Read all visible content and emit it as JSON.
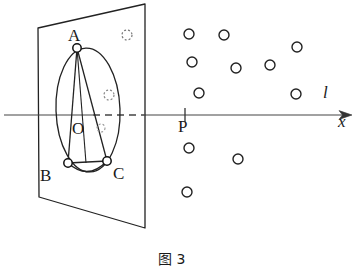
{
  "figure": {
    "caption": "图 3",
    "stroke_color": "#222222",
    "background_color": "#ffffff",
    "labels": {
      "vertex_a": "A",
      "vertex_b": "B",
      "vertex_c": "C",
      "center_o": "O",
      "point_p": "P",
      "line_l": "l",
      "axis_x": "x"
    },
    "label_positions": {
      "vertex_a": {
        "x": 68,
        "y": 27
      },
      "vertex_b": {
        "x": 40,
        "y": 167
      },
      "vertex_c": {
        "x": 113,
        "y": 165
      },
      "center_o": {
        "x": 72,
        "y": 120
      },
      "point_p": {
        "x": 178,
        "y": 118
      },
      "line_l": {
        "x": 323,
        "y": 84
      },
      "axis_x": {
        "x": 338,
        "y": 113
      },
      "caption": {
        "x": 158,
        "y": 252
      }
    },
    "plane": {
      "name": "inclined-plane-quadrilateral",
      "points": "38,28 145,4 145,228 39,197"
    },
    "ellipse": {
      "name": "inscribed-ellipse",
      "cx": 88,
      "cy": 110,
      "rx": 32,
      "ry": 62,
      "rotation": -2
    },
    "triangle": {
      "name": "inscribed-triangle-abc",
      "a": {
        "x": 77,
        "y": 48
      },
      "b": {
        "x": 68,
        "y": 163
      },
      "c": {
        "x": 107,
        "y": 161
      }
    },
    "arc_bc": {
      "name": "arc-bc",
      "path": "M 68,163 Q 88,180 107,161"
    },
    "markers": {
      "vertex_radius": 4.2
    },
    "axis": {
      "name": "number-line-axis",
      "y": 115,
      "x_start": 4,
      "x_end": 352,
      "dash_start": 93,
      "dash_end": 146,
      "arrow_tip_x": 352,
      "tick_p_x": 185,
      "tick_half_height": 7
    },
    "scatter_points": [
      {
        "x": 189,
        "y": 34,
        "r": 5.0
      },
      {
        "x": 224,
        "y": 35,
        "r": 5.0
      },
      {
        "x": 297,
        "y": 47,
        "r": 5.0
      },
      {
        "x": 192,
        "y": 62,
        "r": 5.0
      },
      {
        "x": 236,
        "y": 68,
        "r": 5.0
      },
      {
        "x": 270,
        "y": 65,
        "r": 5.0
      },
      {
        "x": 199,
        "y": 93,
        "r": 5.0
      },
      {
        "x": 296,
        "y": 94,
        "r": 5.0
      },
      {
        "x": 189,
        "y": 148,
        "r": 5.0
      },
      {
        "x": 238,
        "y": 159,
        "r": 5.0
      },
      {
        "x": 187,
        "y": 192,
        "r": 5.0
      }
    ],
    "dotted_circles": [
      {
        "x": 127,
        "y": 35,
        "r": 5.0
      },
      {
        "x": 109,
        "y": 95,
        "r": 5.0
      },
      {
        "x": 101,
        "y": 128,
        "r": 4.0
      }
    ]
  }
}
